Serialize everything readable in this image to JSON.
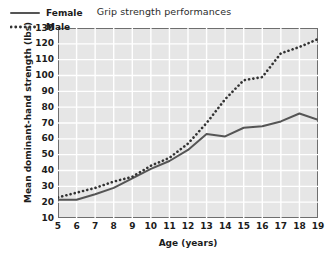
{
  "chart_data": {
    "type": "line",
    "title": "Grip strength performances",
    "xlabel": "Age (years)",
    "ylabel": "Mean dominant-hand strength (lbs)",
    "x": [
      5,
      6,
      7,
      8,
      9,
      10,
      11,
      12,
      13,
      14,
      15,
      16,
      17,
      18,
      19
    ],
    "xticklabels": [
      "5",
      "6",
      "7",
      "8",
      "9",
      "10",
      "11",
      "12",
      "13",
      "14",
      "15",
      "16",
      "17",
      "18",
      "19"
    ],
    "yticklabels": [
      "130",
      "120",
      "110",
      "100",
      "90",
      "80",
      "70",
      "60",
      "50",
      "40",
      "30",
      "20",
      "10"
    ],
    "xlim": [
      5,
      19
    ],
    "ylim": [
      10,
      130
    ],
    "ytick_step": 10,
    "grid": true,
    "grid_color": "#ffffff",
    "plot_background": "#e6e6e6",
    "legend_position": "top-left",
    "series": [
      {
        "name": "Female",
        "style": "solid",
        "color": "#555555",
        "values": [
          21.5,
          21.5,
          25,
          29,
          35,
          41,
          46,
          53,
          63,
          61.5,
          67,
          68,
          71,
          76,
          72
        ]
      },
      {
        "name": "Male",
        "style": "dotted",
        "color": "#333333",
        "values": [
          23,
          26,
          29,
          33,
          36,
          43,
          48,
          57,
          70,
          85,
          97,
          99,
          114,
          118,
          123
        ]
      }
    ]
  }
}
